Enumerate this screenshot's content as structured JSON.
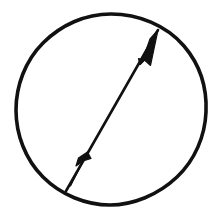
{
  "figure": {
    "title": "Circle with double-headed diameter arrow",
    "background_color": "#ffffff",
    "ink_color": "#111111",
    "canvas": {
      "width": 222,
      "height": 218
    },
    "shapes": {
      "circle": {
        "name": "circle-outline",
        "center_x": 111,
        "center_y": 110,
        "radius_x": 92,
        "radius_y": 96,
        "stroke_width": 3.6,
        "stroke_color": "#111111",
        "fill": "none"
      },
      "arrow": {
        "name": "diameter-double-arrow",
        "start_x": 66,
        "start_y": 191,
        "end_x": 158,
        "end_y": 30,
        "shaft_width": 2.6,
        "stroke_color": "#111111",
        "heads": 2,
        "head_style": "barbed-swallowtail",
        "head_upper": {
          "name": "arrowhead-upper-right",
          "tip_x": 158,
          "tip_y": 30,
          "length": 34,
          "half_width": 7
        },
        "head_lower": {
          "name": "arrowhead-lower-left",
          "tip_x": 72,
          "tip_y": 183,
          "length": 33,
          "half_width": 9
        }
      }
    }
  }
}
